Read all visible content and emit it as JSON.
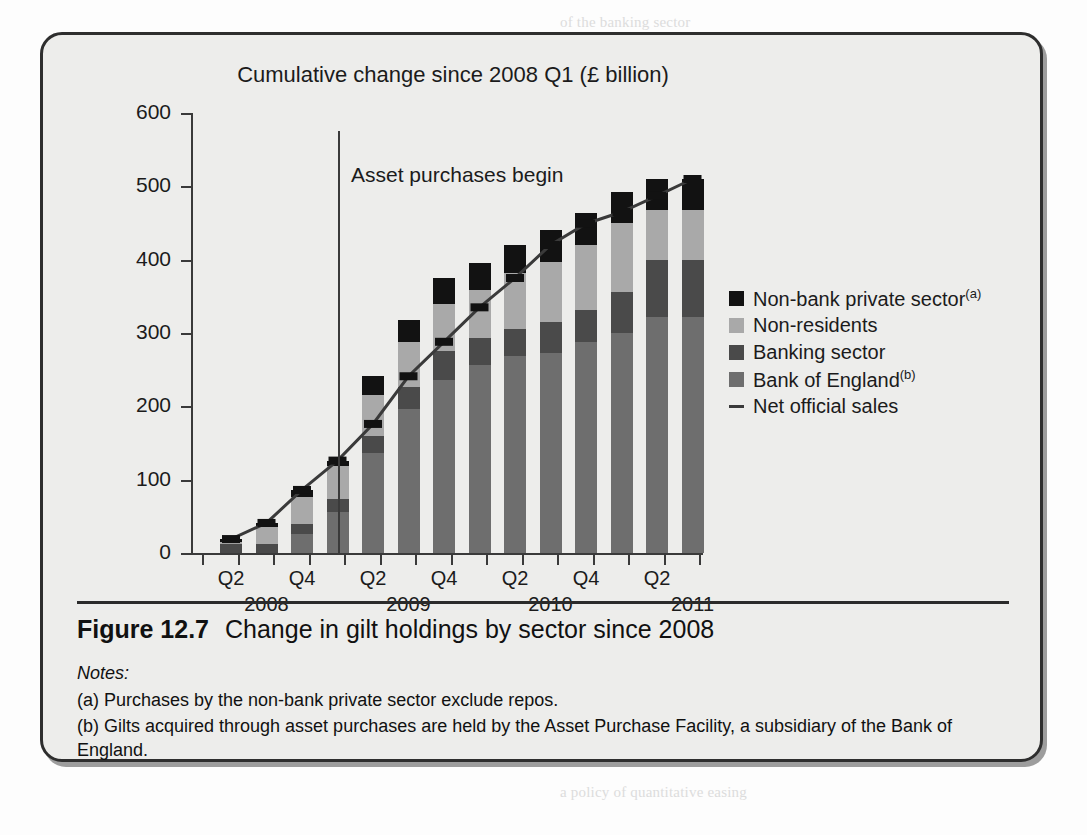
{
  "figure": {
    "number": "Figure 12.7",
    "caption": "Change in gilt holdings by sector since 2008",
    "notes_heading": "Notes:",
    "note_a": "(a) Purchases by the non-bank private sector exclude repos.",
    "note_b": "(b) Gilts acquired through asset purchases are held by the Asset Purchase Facility, a subsidiary of the Bank of England."
  },
  "annotation": {
    "text": "Asset purchases begin",
    "at_category": "2009 Q1"
  },
  "colors": {
    "non_bank_private_sector": "#121212",
    "non_residents": "#a9a9a9",
    "banking_sector": "#4a4a4a",
    "bank_of_england": "#6e6e6e",
    "net_official_sales_line": "#3a3a3a",
    "panel_background": "#ededeb",
    "border": "#2e2e2e"
  },
  "chart_data": {
    "type": "bar",
    "stacked": true,
    "title": "Cumulative change since 2008 Q1 (£ billion)",
    "xlabel": "",
    "ylabel": "",
    "ylim": [
      0,
      600
    ],
    "yticks": [
      0,
      100,
      200,
      300,
      400,
      500,
      600
    ],
    "grid": false,
    "legend_position": "right",
    "categories": [
      "2008 Q2",
      "2008 Q3",
      "2008 Q4",
      "2009 Q1",
      "2009 Q2",
      "2009 Q3",
      "2009 Q4",
      "2010 Q1",
      "2010 Q2",
      "2010 Q3",
      "2010 Q4",
      "2011 Q1",
      "2011 Q2",
      "2011 Q3"
    ],
    "tick_labels": [
      {
        "index": 0,
        "label": "Q2"
      },
      {
        "index": 2,
        "label": "Q4"
      },
      {
        "index": 4,
        "label": "Q2"
      },
      {
        "index": 6,
        "label": "Q4"
      },
      {
        "index": 8,
        "label": "Q2"
      },
      {
        "index": 10,
        "label": "Q4"
      },
      {
        "index": 12,
        "label": "Q2"
      }
    ],
    "year_labels": [
      {
        "index": 1,
        "label": "2008"
      },
      {
        "index": 5,
        "label": "2009"
      },
      {
        "index": 9,
        "label": "2010"
      },
      {
        "index": 13,
        "label": "2011"
      }
    ],
    "series": [
      {
        "name": "Bank of England",
        "color": "#6e6e6e",
        "values": [
          0,
          0,
          26,
          56,
          137,
          196,
          236,
          257,
          268,
          273,
          288,
          300,
          322,
          322
        ]
      },
      {
        "name": "Banking sector",
        "color": "#4a4a4a",
        "values": [
          12,
          12,
          14,
          18,
          22,
          30,
          40,
          36,
          38,
          42,
          44,
          56,
          78,
          78
        ]
      },
      {
        "name": "Non-residents",
        "color": "#a9a9a9",
        "values": [
          3,
          24,
          36,
          44,
          56,
          62,
          64,
          66,
          76,
          82,
          88,
          94,
          68,
          68
        ]
      },
      {
        "name": "Non-bank private sector",
        "color": "#121212",
        "values": [
          4,
          5,
          10,
          8,
          26,
          30,
          35,
          36,
          38,
          44,
          44,
          42,
          42,
          42
        ]
      }
    ],
    "line_series": {
      "name": "Net official sales",
      "color": "#3a3a3a",
      "values": [
        19,
        41,
        86,
        126,
        176,
        241,
        288,
        335,
        375,
        420,
        449,
        465,
        487,
        510
      ]
    },
    "legend": [
      {
        "label": "Non-bank private sector",
        "sup": "(a)",
        "marker": "square",
        "color": "#121212"
      },
      {
        "label": "Non-residents",
        "sup": "",
        "marker": "square",
        "color": "#a9a9a9"
      },
      {
        "label": "Banking sector",
        "sup": "",
        "marker": "square",
        "color": "#4a4a4a"
      },
      {
        "label": "Bank of England",
        "sup": "(b)",
        "marker": "square",
        "color": "#6e6e6e"
      },
      {
        "label": "Net official sales",
        "sup": "",
        "marker": "line",
        "color": "#3a3a3a"
      }
    ]
  }
}
